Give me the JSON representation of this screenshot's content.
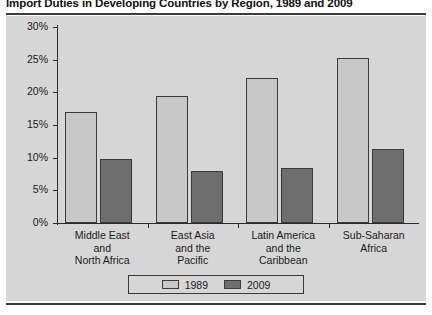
{
  "chart_data": {
    "type": "bar",
    "title": "Import Duties in Developing Countries by Region, 1989 and 2009",
    "xlabel": "",
    "ylabel": "",
    "ylim": [
      0,
      30
    ],
    "ytick_values": [
      30,
      25,
      20,
      15,
      10,
      5,
      0
    ],
    "ytick_labels": [
      "30%",
      "25%",
      "20%",
      "15%",
      "10%",
      "5%",
      "0%"
    ],
    "grid": false,
    "legend_position": "bottom-center",
    "categories": [
      "Middle East\nand\nNorth Africa",
      "East Asia\nand the\nPacific",
      "Latin America\nand the\nCaribbean",
      "Sub-Saharan\nAfrica"
    ],
    "category_lines": [
      [
        "Middle East",
        "and",
        "North Africa"
      ],
      [
        "East Asia",
        "and the",
        "Pacific"
      ],
      [
        "Latin America",
        "and the",
        "Caribbean"
      ],
      [
        "Sub-Saharan",
        "Africa"
      ]
    ],
    "series": [
      {
        "name": "1989",
        "color": "#c8c8c8",
        "values": [
          17.0,
          19.4,
          22.2,
          25.2
        ]
      },
      {
        "name": "2009",
        "color": "#6e6e6e",
        "values": [
          9.8,
          8.0,
          8.4,
          11.3
        ]
      }
    ]
  },
  "colors": {
    "panel_background": "#d6d6d6",
    "page_background": "#ffffff",
    "axis": "#2a2a2a",
    "rule": "#3c3c3c",
    "text": "#1b1b1b",
    "bar_1989": "#c8c8c8",
    "bar_2009": "#6e6e6e"
  }
}
